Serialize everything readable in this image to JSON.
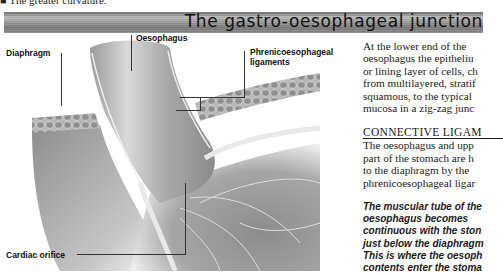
{
  "page": {
    "top_line": "■ The greater curvature.",
    "banner_title": "The gastro-oesophageal junction"
  },
  "figure": {
    "labels": {
      "oesophagus": "Oesophagus",
      "diaphragm": "Diaphragm",
      "phrenico": [
        "Phrenicoesophageal",
        "ligaments"
      ],
      "cardiac": "Cardiac orifice"
    }
  },
  "text": {
    "intro_lines": [
      "At the lower end of the",
      "oesophagus the epitheliu",
      "or lining layer of cells, ch",
      "from multilayered, stratif",
      "squamous, to the typical",
      "mucosa in a zig-zag junc"
    ],
    "heading": "CONNECTIVE LIGAM",
    "body_lines": [
      "The oesophagus and upp",
      "part of the stomach are h",
      "to the diaphragm by the",
      "phrenicoesophageal ligar"
    ],
    "caption_lines": [
      "The muscular tube of the",
      "oesophagus becomes",
      "continuous with the ston",
      "just below the diaphragm",
      "This is where the oesoph",
      "contents enter the stoma"
    ]
  }
}
